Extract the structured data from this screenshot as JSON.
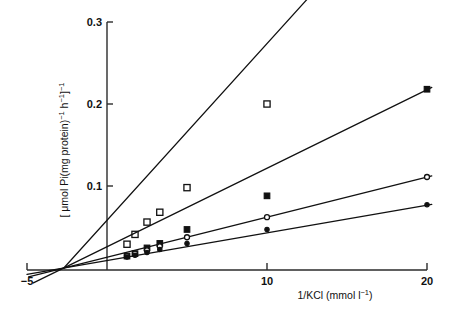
{
  "figure": {
    "background": "#ffffff",
    "ink": "#111111"
  },
  "chart_data": {
    "type": "line",
    "title": "",
    "subtitle": "",
    "xlabel": "1/KCl (mmol l⁻¹)",
    "ylabel": "[ μmol Pi(mg protein)⁻¹ h⁻¹]⁻¹",
    "xlabel_parts": {
      "base": "1/KCl (mmol l",
      "exponent": "−1",
      "tail": ")"
    },
    "ylabel_parts": {
      "open": "[ μmol Pi(mg protein)",
      "exp1": "−1",
      "mid": " h",
      "exp2": "−1",
      "close": "]",
      "exp3": "−1"
    },
    "xlim": [
      -5,
      20
    ],
    "ylim": [
      0,
      0.3
    ],
    "xticks": [
      -5,
      10,
      20
    ],
    "xtick_labels": [
      "−5",
      "10",
      "20"
    ],
    "yticks": [
      0.1,
      0.2,
      0.3
    ],
    "ytick_labels": [
      "0.1",
      "0.2",
      "0.3"
    ],
    "grid": false,
    "legend_position": "none",
    "x_axis_position": "bottom",
    "y_axis_position": "x=0",
    "convergence_x": -2.7,
    "series": [
      {
        "name": "open-square",
        "marker": "open-square",
        "marker_size": 6.2,
        "fill": "#ffffff",
        "stroke": "#111111",
        "slope": 0.02155,
        "x_intercept": -2.7,
        "line_x_range": [
          -2.7,
          13.6
        ],
        "x": [
          1.25,
          1.75,
          2.5,
          3.3,
          5.0,
          10.0
        ],
        "y": [
          0.029,
          0.041,
          0.056,
          0.068,
          0.098,
          0.2
        ]
      },
      {
        "name": "filled-square",
        "marker": "filled-square",
        "marker_size": 5.6,
        "fill": "#111111",
        "stroke": "#111111",
        "slope": 0.00958,
        "x_intercept": -2.7,
        "line_x_range": [
          -4.6,
          20.3
        ],
        "x": [
          1.25,
          1.75,
          2.5,
          3.3,
          5.0,
          10.0,
          20.0
        ],
        "y": [
          0.0145,
          0.0175,
          0.0245,
          0.03,
          0.047,
          0.088,
          0.218
        ]
      },
      {
        "name": "open-circle",
        "marker": "open-circle",
        "marker_size": 5.0,
        "fill": "#ffffff",
        "stroke": "#111111",
        "slope": 0.00488,
        "x_intercept": -2.7,
        "line_x_range": [
          -4.9,
          20.3
        ],
        "x": [
          1.25,
          1.75,
          2.5,
          3.3,
          5.0,
          10.0,
          20.0
        ],
        "y": [
          0.0145,
          0.0175,
          0.0215,
          0.0265,
          0.0375,
          0.062,
          0.111
        ]
      },
      {
        "name": "filled-circle",
        "marker": "filled-circle",
        "marker_size": 4.4,
        "fill": "#111111",
        "stroke": "#111111",
        "slope": 0.00337,
        "x_intercept": -2.7,
        "line_x_range": [
          -5.0,
          20.3
        ],
        "x": [
          1.25,
          1.75,
          2.5,
          3.3,
          5.0,
          10.0,
          20.0
        ],
        "y": [
          0.0135,
          0.0155,
          0.019,
          0.0225,
          0.03,
          0.047,
          0.077
        ]
      }
    ]
  }
}
